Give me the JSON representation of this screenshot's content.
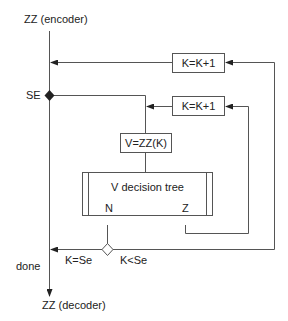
{
  "diagram": {
    "type": "flowchart",
    "nodes": {
      "start": "ZZ (encoder)",
      "se_label": "SE",
      "increment_outer": "K=K+1",
      "increment_inner": "K=K+1",
      "assign": "V=ZZ(K)",
      "decision_tree": "V decision tree",
      "tree_port_n": "N",
      "tree_port_z": "Z",
      "branch_equal": "K=Se",
      "branch_less": "K<Se",
      "done_label": "done",
      "end": "ZZ (decoder)"
    },
    "edges": [
      {
        "from": "ZZ (encoder)",
        "to": "SE"
      },
      {
        "from": "SE",
        "to": "V=ZZ(K)"
      },
      {
        "from": "V=ZZ(K)",
        "to": "V decision tree"
      },
      {
        "from": "V decision tree",
        "to": "K compare",
        "label": "N"
      },
      {
        "from": "V decision tree",
        "to": "K=K+1 (inner)",
        "label": "Z"
      },
      {
        "from": "K=K+1 (inner)",
        "to": "V=ZZ(K)"
      },
      {
        "from": "K compare",
        "to": "K=K+1 (outer)",
        "label": "K<Se"
      },
      {
        "from": "K=K+1 (outer)",
        "to": "main line"
      },
      {
        "from": "K compare",
        "to": "ZZ (decoder)",
        "label": "K=Se"
      },
      {
        "from": "main line",
        "to": "ZZ (decoder)",
        "label": "done"
      }
    ],
    "colors": {
      "line": "#555555",
      "text": "#222222",
      "background": "#ffffff"
    }
  }
}
